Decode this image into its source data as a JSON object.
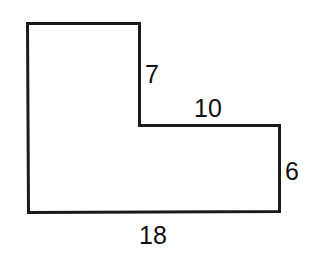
{
  "diagram": {
    "shape": "L-shaped polygon",
    "stroke_color": "#1a1a1a",
    "labels": {
      "inner_vertical": "7",
      "inner_horizontal": "10",
      "right_side": "6",
      "bottom_side": "18"
    }
  }
}
